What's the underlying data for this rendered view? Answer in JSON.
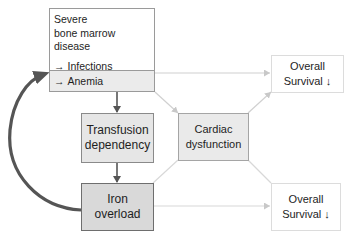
{
  "diagram": {
    "nodes": {
      "severe_disease": {
        "title_line1": "Severe",
        "title_line2": "bone marrow disease",
        "items": [
          {
            "arrow": "→",
            "label": "Infections"
          },
          {
            "arrow": "→",
            "label": "Bleeding"
          }
        ],
        "highlight_item": {
          "arrow": "→",
          "label": "Anemia"
        }
      },
      "transfusion": {
        "line1": "Transfusion",
        "line2": "dependency"
      },
      "iron_overload": {
        "line1": "Iron",
        "line2": "overload"
      },
      "cardiac": {
        "line1": "Cardiac",
        "line2": "dysfunction"
      },
      "survival_top": {
        "line1": "Overall",
        "line2": "Survival ↓"
      },
      "survival_bottom": {
        "line1": "Overall",
        "line2": "Survival ↓"
      }
    },
    "edges": [
      {
        "from": "anemia",
        "to": "transfusion",
        "style": "dark"
      },
      {
        "from": "transfusion",
        "to": "iron_overload",
        "style": "dark"
      },
      {
        "from": "iron_overload",
        "to": "anemia",
        "style": "dark-curved"
      },
      {
        "from": "anemia",
        "to": "survival_top",
        "style": "light"
      },
      {
        "from": "anemia",
        "to": "cardiac",
        "style": "light"
      },
      {
        "from": "cardiac",
        "to": "survival_top",
        "style": "light"
      },
      {
        "from": "iron_overload",
        "to": "cardiac",
        "style": "light"
      },
      {
        "from": "cardiac",
        "to": "survival_bottom",
        "style": "light"
      },
      {
        "from": "iron_overload",
        "to": "survival_bottom",
        "style": "light"
      }
    ],
    "colors": {
      "dark_arrow": "#555555",
      "light_arrow": "#d0d0d0",
      "box_gray": "#e6e6e6",
      "box_dark": "#d9d9d9"
    }
  }
}
